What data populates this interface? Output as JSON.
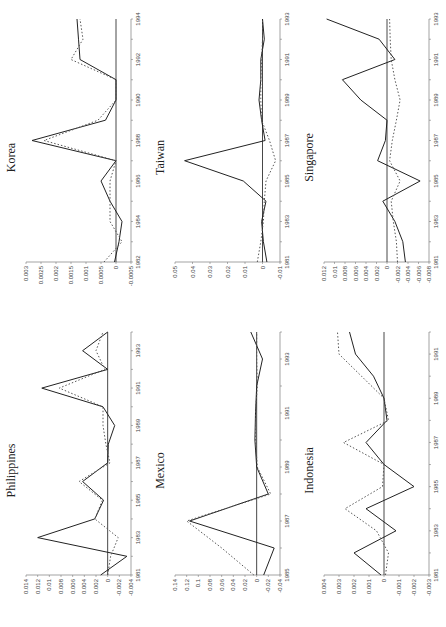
{
  "figure": {
    "panels": [
      {
        "id": "philippines",
        "title": "Philippines"
      },
      {
        "id": "korea",
        "title": "Korea"
      },
      {
        "id": "mexico",
        "title": "Mexico"
      },
      {
        "id": "taiwan",
        "title": "Taiwan"
      },
      {
        "id": "indonesia",
        "title": "Indonesia"
      },
      {
        "id": "singapore",
        "title": "Singapore"
      }
    ]
  },
  "chart_data": [
    {
      "type": "line",
      "title": "Korea",
      "x": [
        1982,
        1983,
        1984,
        1985,
        1986,
        1987,
        1988,
        1989,
        1990,
        1991,
        1992,
        1993,
        1994
      ],
      "xticks": [
        1982,
        1984,
        1986,
        1988,
        1990,
        1992,
        1994
      ],
      "ylim": [
        -0.0005,
        0.003
      ],
      "yticks": [
        -0.0005,
        0,
        0.0005,
        0.001,
        0.0015,
        0.002,
        0.0025,
        0.003
      ],
      "series": [
        {
          "name": "solid",
          "style": "solid",
          "values": [
            5e-05,
            -0.0001,
            -0.0002,
            0.0002,
            0.0005,
            0.0,
            0.0028,
            0.00035,
            0.0,
            0.0,
            0.0012,
            0.00125,
            0.0013
          ]
        },
        {
          "name": "dotted",
          "style": "dotted",
          "values": [
            0.0004,
            -0.0002,
            0.0002,
            0.0002,
            0.0002,
            0.0,
            0.0024,
            0.0006,
            0.0,
            0.0,
            0.0015,
            0.0011,
            0.0012
          ]
        }
      ]
    },
    {
      "type": "line",
      "title": "Taiwan",
      "x": [
        1981,
        1982,
        1983,
        1984,
        1985,
        1986,
        1987,
        1988,
        1989,
        1990,
        1991,
        1992,
        1993
      ],
      "xticks": [
        1981,
        1983,
        1985,
        1987,
        1989,
        1991,
        1993
      ],
      "ylim": [
        -0.01,
        0.05
      ],
      "yticks": [
        -0.01,
        0,
        0.01,
        0.02,
        0.03,
        0.04,
        0.05
      ],
      "series": [
        {
          "name": "solid",
          "style": "solid",
          "values": [
            -0.0025,
            -0.0005,
            0.0005,
            -0.002,
            0.011,
            0.0445,
            -0.0015,
            0.0005,
            0.002,
            0.001,
            0.001,
            -0.001,
            0.0
          ]
        },
        {
          "name": "dotted",
          "style": "dotted",
          "values": [
            0.003,
            0.001,
            -0.0005,
            -0.001,
            -0.002,
            -0.0075,
            -0.004,
            0.0005,
            0.001,
            0.001,
            0.0005,
            0.0,
            0.0
          ]
        }
      ]
    },
    {
      "type": "line",
      "title": "Singapore",
      "x": [
        1981,
        1982,
        1983,
        1984,
        1985,
        1986,
        1987,
        1988,
        1989,
        1990,
        1991,
        1992,
        1993
      ],
      "xticks": [
        1981,
        1983,
        1985,
        1987,
        1989,
        1991,
        1993
      ],
      "ylim": [
        -0.008,
        0.012
      ],
      "yticks": [
        -0.008,
        -0.006,
        -0.004,
        -0.002,
        0,
        0.002,
        0.004,
        0.006,
        0.008,
        0.01,
        0.012
      ],
      "series": [
        {
          "name": "solid",
          "style": "solid",
          "values": [
            -0.0035,
            -0.003,
            -0.0015,
            0.0008,
            -0.0063,
            0.0018,
            0.0003,
            0.0,
            0.005,
            0.0085,
            -0.0015,
            0.0015,
            0.0115
          ]
        },
        {
          "name": "dotted",
          "style": "dotted",
          "values": [
            -0.002,
            -0.0018,
            -0.0012,
            -0.0008,
            -0.0025,
            -0.0005,
            -0.001,
            -0.0018,
            -0.0025,
            -0.0015,
            -0.0008,
            -0.0006,
            -0.0005
          ]
        }
      ]
    },
    {
      "type": "line",
      "title": "Philippines",
      "x": [
        1981,
        1982,
        1983,
        1984,
        1985,
        1986,
        1987,
        1988,
        1989,
        1990,
        1991,
        1992,
        1993,
        1994
      ],
      "xticks": [
        1981,
        1983,
        1985,
        1987,
        1989,
        1991,
        1993
      ],
      "ylim": [
        -0.004,
        0.014
      ],
      "yticks": [
        -0.004,
        -0.002,
        0,
        0.002,
        0.004,
        0.006,
        0.008,
        0.01,
        0.012,
        0.014
      ],
      "series": [
        {
          "name": "solid",
          "style": "solid",
          "values": [
            0.0012,
            -0.0033,
            0.012,
            0.0022,
            0.0007,
            0.0043,
            0.0,
            -0.0001,
            -0.0012,
            0.0008,
            0.0113,
            0.0,
            0.0043,
            0.0
          ]
        },
        {
          "name": "dotted",
          "style": "dotted",
          "values": [
            0.0,
            -0.0005,
            -0.0018,
            0.0022,
            0.0009,
            0.0049,
            -0.0004,
            0.0003,
            0.0008,
            0.0008,
            0.0083,
            0.0005,
            0.002,
            0.0008
          ]
        }
      ]
    },
    {
      "type": "line",
      "title": "Mexico",
      "x": [
        1985,
        1986,
        1987,
        1988,
        1989,
        1990,
        1991,
        1992,
        1993,
        1994
      ],
      "xticks": [
        1985,
        1987,
        1989,
        1991,
        1993
      ],
      "ylim": [
        -0.04,
        0.14
      ],
      "yticks": [
        -0.04,
        -0.02,
        0,
        0.02,
        0.04,
        0.06,
        0.08,
        0.1,
        0.12,
        0.14
      ],
      "series": [
        {
          "name": "solid",
          "style": "solid",
          "values": [
            -0.012,
            -0.03,
            0.115,
            -0.02,
            0.0,
            0.003,
            0.002,
            0.0,
            -0.01,
            0.01
          ]
        },
        {
          "name": "dotted",
          "style": "dotted",
          "values": [
            0.005,
            0.06,
            0.12,
            -0.024,
            -0.001,
            0.002,
            0.002,
            -0.001,
            0.0,
            0.0
          ]
        }
      ]
    },
    {
      "type": "line",
      "title": "Indonesia",
      "x": [
        1981,
        1982,
        1983,
        1984,
        1985,
        1986,
        1987,
        1988,
        1989,
        1990,
        1991,
        1992
      ],
      "xticks": [
        1981,
        1983,
        1985,
        1987,
        1989,
        1991
      ],
      "ylim": [
        -0.003,
        0.004
      ],
      "yticks": [
        -0.003,
        -0.002,
        -0.001,
        0,
        0.001,
        0.002,
        0.003,
        0.004
      ],
      "series": [
        {
          "name": "solid",
          "style": "solid",
          "values": [
            0.0002,
            0.002,
            -0.0008,
            0.0012,
            -0.002,
            0.0,
            0.0012,
            -0.0002,
            0.0,
            0.0007,
            0.0019,
            0.0023
          ]
        },
        {
          "name": "dotted",
          "style": "dotted",
          "values": [
            -0.0001,
            -0.0003,
            0.0005,
            0.0026,
            0.0001,
            0.0,
            0.0027,
            -0.0003,
            0.0,
            0.0015,
            0.003,
            0.0031
          ]
        }
      ]
    }
  ]
}
